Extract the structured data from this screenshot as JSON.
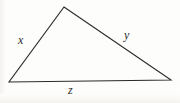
{
  "figure": {
    "type": "triangle-diagram",
    "background_color": "#fdfdfc",
    "stroke_color": "#2b2b2b",
    "stroke_width": 1.1,
    "canvas": {
      "width": 180,
      "height": 103
    },
    "vertices": {
      "apex": {
        "x": 64,
        "y": 7
      },
      "bottom_left": {
        "x": 9,
        "y": 82
      },
      "bottom_right": {
        "x": 171,
        "y": 80
      }
    },
    "sides": [
      {
        "name": "left-side",
        "label": "x",
        "from": "bottom_left",
        "to": "apex",
        "label_position": {
          "x": 18,
          "y": 34
        }
      },
      {
        "name": "right-side",
        "label": "y",
        "from": "apex",
        "to": "bottom_right",
        "label_position": {
          "x": 124,
          "y": 29
        }
      },
      {
        "name": "bottom-side",
        "label": "z",
        "from": "bottom_left",
        "to": "bottom_right",
        "label_position": {
          "x": 68,
          "y": 84
        }
      }
    ]
  }
}
